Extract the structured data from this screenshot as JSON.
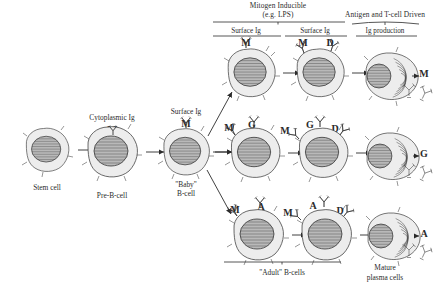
{
  "figure": {
    "type": "diagram",
    "palette": {
      "ink": "#2f2f2f",
      "nucleus": "#b9b9b9",
      "cytoplasm": "#ededed",
      "background": "#ffffff"
    }
  },
  "headers": {
    "mitogen": {
      "line1": "Mitogen Inducible",
      "line2": "(e.g. LPS)"
    },
    "antigen": {
      "line1": "Antigen and T-cell Driven",
      "line2": "Ig production"
    }
  },
  "column_labels": {
    "surface_ig_1": "Surface Ig",
    "surface_ig_2": "Surface Ig",
    "cytoplasmic_ig": "Cytoplasmic Ig",
    "surface_ig_baby": "Surface Ig"
  },
  "stage_captions": {
    "stem": "Stem cell",
    "pre_b": "Pre-B-cell",
    "baby_b_line1": "\"Baby\"",
    "baby_b_line2": "B-cell",
    "adult_b": "\"Adult\" B-cells",
    "plasma_line1": "Mature",
    "plasma_line2": "plasma cells"
  },
  "isotypes": {
    "m": "M",
    "d": "D",
    "g": "G",
    "a": "A"
  },
  "rows": [
    {
      "id": "row-igm",
      "name": "IgM pathway",
      "surface_first": [
        "M"
      ],
      "surface_second": [
        "M",
        "D"
      ],
      "secreted": "M"
    },
    {
      "id": "row-igg",
      "name": "IgG pathway",
      "surface_first": [
        "M",
        "G"
      ],
      "surface_second": [
        "M",
        "G",
        "D"
      ],
      "secreted": "G"
    },
    {
      "id": "row-iga",
      "name": "IgA pathway",
      "surface_first": [
        "M",
        "A"
      ],
      "surface_second": [
        "M",
        "A",
        "D"
      ],
      "secreted": "A"
    }
  ],
  "linear_stages": [
    {
      "id": "stem-cell",
      "caption": "Stem cell",
      "marker": ""
    },
    {
      "id": "pre-b-cell",
      "caption": "Pre-B-cell",
      "marker": "M",
      "marker_location": "cytoplasmic"
    },
    {
      "id": "baby-b-cell",
      "caption": "\"Baby\" B-cell",
      "marker": "M",
      "marker_location": "surface"
    }
  ]
}
